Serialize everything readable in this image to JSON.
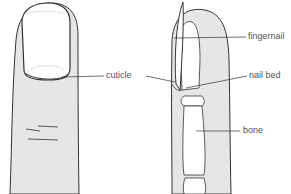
{
  "diagram": {
    "labels": {
      "cuticle": "cuticle",
      "fingernail": "fingernail",
      "nail_bed": "nail bed",
      "bone": "bone"
    },
    "colors": {
      "skin": "#e6e6e6",
      "outline": "#333333",
      "bone": "#ffffff",
      "text": "#555555"
    }
  }
}
